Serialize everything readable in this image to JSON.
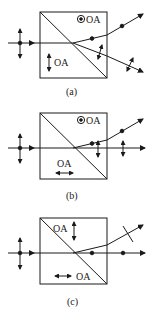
{
  "figure": {
    "panels": [
      {
        "id": "a",
        "caption": "(a)",
        "prism1_axis_label": "OA",
        "prism1_axis": "vertical-arrow",
        "prism2_axis_label": "OA",
        "prism2_axis": "dot-out-of-plane",
        "output_rays": [
          "deflected-up-dot-polarized",
          "deflected-down-vertical-polarized"
        ]
      },
      {
        "id": "b",
        "caption": "(b)",
        "prism1_axis_label": "OA",
        "prism1_axis": "horizontal-arrow",
        "prism2_axis_label": "OA",
        "prism2_axis": "dot-out-of-plane",
        "output_rays": [
          "deflected-up-dot-polarized",
          "straight-vertical-polarized"
        ]
      },
      {
        "id": "c",
        "caption": "(c)",
        "prism1_axis_label": "OA",
        "prism1_axis": "horizontal-arrow",
        "prism2_axis_label": "OA",
        "prism2_axis": "vertical-arrow",
        "output_rays": [
          "deflected-up-tilted-polarized",
          "straight-dot-polarized"
        ]
      }
    ],
    "colors": {
      "line": "#1a1a1a",
      "background": "#ffffff"
    }
  }
}
